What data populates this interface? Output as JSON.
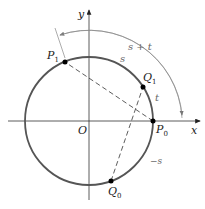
{
  "diagram": {
    "type": "unit-circle-arc-addition",
    "colors": {
      "circle": "#555555",
      "axes": "#333333",
      "arc_annotation": "#888888",
      "dashed": "#333333",
      "points": "#000000"
    },
    "axes": {
      "x_label": "x",
      "y_label": "y",
      "origin_label": "O"
    },
    "points": [
      {
        "name": "P",
        "sub": "0"
      },
      {
        "name": "P",
        "sub": "1"
      },
      {
        "name": "Q",
        "sub": "0"
      },
      {
        "name": "Q",
        "sub": "1"
      }
    ],
    "arc_labels": {
      "s": "s",
      "t": "t",
      "s_plus_t": "s + t",
      "neg_s": "−s"
    }
  }
}
